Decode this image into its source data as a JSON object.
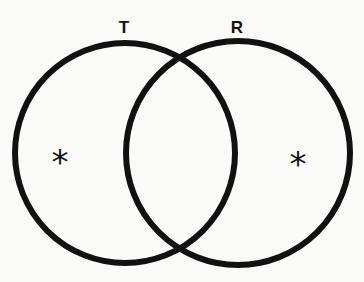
{
  "diagram": {
    "type": "venn",
    "sets": [
      {
        "id": "T",
        "label": "T",
        "cx": 125,
        "cy": 153,
        "r": 110,
        "label_x": 124,
        "label_y": 27
      },
      {
        "id": "R",
        "label": "R",
        "cx": 238,
        "cy": 153,
        "r": 112,
        "label_x": 237,
        "label_y": 27
      }
    ],
    "markers": [
      {
        "symbol": "*",
        "region": "T only",
        "x": 60,
        "y": 158
      },
      {
        "symbol": "*",
        "region": "R only",
        "x": 298,
        "y": 160
      }
    ],
    "stroke_color": "#111111",
    "background_color": "#fafaf8"
  }
}
